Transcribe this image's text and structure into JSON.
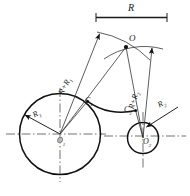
{
  "figure": {
    "title_label": "R",
    "type": "engineering-construction-drawing"
  },
  "labels": {
    "radius_main": "R",
    "sum_left": "R+R",
    "sum_left_sub": "1",
    "sum_right": "R+R",
    "sum_right_sub": "2",
    "circle1_radius": "R",
    "circle1_radius_sub": "1",
    "circle2_radius": "R",
    "circle2_radius_sub": "2",
    "center1": "O",
    "center1_sub": "1",
    "center2": "O",
    "center2_sub": "2",
    "apex": "O",
    "tangent1": "C",
    "tangent1_sub": "1",
    "tangent2": "C",
    "tangent2_sub": "2"
  },
  "geometry": {
    "circle1": {
      "cx": 60,
      "cy": 134,
      "r": 40.5
    },
    "circle2": {
      "cx": 143,
      "cy": 138,
      "r": 15.5
    },
    "apex": {
      "x": 126,
      "y": 47
    },
    "tangent1": {
      "x": 87.5,
      "y": 101
    },
    "tangent2": {
      "x": 135.5,
      "y": 110
    },
    "blend_arc_radius": 58,
    "centerline_y1": 134,
    "centerline_y2": 138,
    "dimension_line": {
      "x1": 96,
      "y1": 17,
      "x2": 167,
      "y2": 17
    }
  },
  "colors": {
    "stroke": "#1a1a1a",
    "thin": "#3a3a3a",
    "background": "#ffffff"
  }
}
